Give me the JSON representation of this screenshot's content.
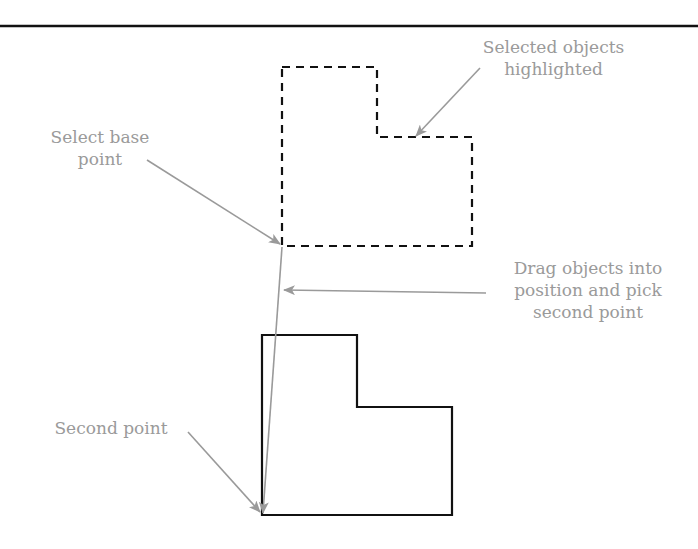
{
  "diagram": {
    "colors": {
      "background": "#ffffff",
      "shape_stroke": "#111111",
      "annotation": "#9a9a9a",
      "rule": "#111111"
    },
    "labels": {
      "selected": {
        "line1": "Selected objects",
        "line2": "highlighted"
      },
      "base_point": {
        "line1": "Select base",
        "line2": "point"
      },
      "drag": {
        "line1": "Drag objects into",
        "line2": "position and pick",
        "line3": "second point"
      },
      "second_point": {
        "line1": "Second point"
      }
    },
    "shapes": {
      "selected_outline": {
        "style": "dashed",
        "points": "282,67 377,67 377,137 472,137 472,246 282,246"
      },
      "moved_outline": {
        "style": "solid",
        "points": "262,335 357,335 357,407 452,407 452,515 262,515"
      }
    },
    "arrows": [
      {
        "name": "selected-arrow",
        "from": [
          480,
          68
        ],
        "to": [
          416,
          136
        ]
      },
      {
        "name": "base-point-arrow",
        "from": [
          147,
          160
        ],
        "to": [
          280,
          244
        ]
      },
      {
        "name": "drag-arrow",
        "from": [
          486,
          293
        ],
        "to": [
          284,
          290
        ]
      },
      {
        "name": "second-point-arrow",
        "from": [
          188,
          432
        ],
        "to": [
          260,
          512
        ]
      },
      {
        "name": "move-vector",
        "from": [
          282,
          247
        ],
        "to": [
          263,
          513
        ]
      }
    ]
  }
}
